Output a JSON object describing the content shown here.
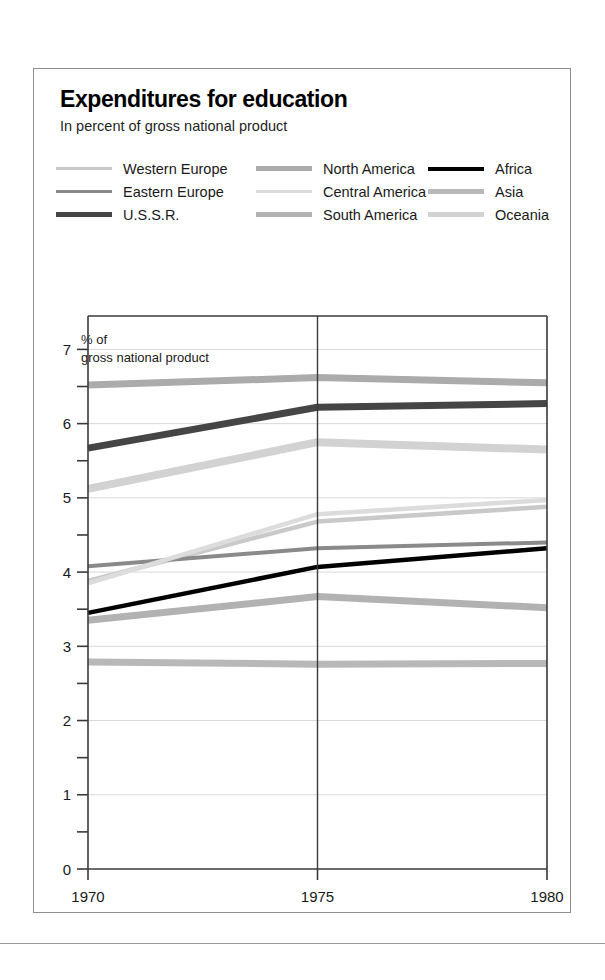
{
  "figure": {
    "title": "Expenditures for education",
    "subtitle": "In percent of gross national product",
    "axis_caption_line1": "% of",
    "axis_caption_line2": "gross national product"
  },
  "chart_data": {
    "type": "line",
    "title": "Expenditures for education",
    "subtitle": "In percent of gross national product",
    "xlabel": "",
    "ylabel": "% of gross national product",
    "x": [
      1970,
      1975,
      1980
    ],
    "xtick_labels": [
      "1970",
      "1975",
      "1980"
    ],
    "ytick_labels": [
      "0",
      "1",
      "2",
      "3",
      "4",
      "5",
      "6",
      "7"
    ],
    "yticks": [
      0,
      1,
      2,
      3,
      4,
      5,
      6,
      7
    ],
    "minor_yticks": [
      0.5,
      1.5,
      2.5,
      3.5,
      4.5,
      5.5,
      6.5
    ],
    "ylim": [
      0,
      7.45
    ],
    "xlim": [
      1970,
      1980
    ],
    "grid": "horizontal-light",
    "legend_position": "top",
    "series": [
      {
        "name": "Western Europe",
        "values": [
          3.88,
          4.68,
          4.88
        ],
        "color": "#c9c9c9",
        "width": 4.5
      },
      {
        "name": "Eastern Europe",
        "values": [
          4.08,
          4.32,
          4.4
        ],
        "color": "#8a8a8a",
        "width": 4.0
      },
      {
        "name": "U.S.S.R.",
        "values": [
          5.67,
          6.22,
          6.27
        ],
        "color": "#454545",
        "width": 7.0
      },
      {
        "name": "North America",
        "values": [
          6.52,
          6.62,
          6.55
        ],
        "color": "#ababab",
        "width": 7.0
      },
      {
        "name": "Central America",
        "values": [
          3.85,
          4.78,
          4.97
        ],
        "color": "#dcdcdc",
        "width": 4.5
      },
      {
        "name": "South America",
        "values": [
          3.35,
          3.67,
          3.52
        ],
        "color": "#b2b2b2",
        "width": 7.0
      },
      {
        "name": "Africa",
        "values": [
          3.45,
          4.07,
          4.32
        ],
        "color": "#000000",
        "width": 4.5
      },
      {
        "name": "Asia",
        "values": [
          2.79,
          2.76,
          2.77
        ],
        "color": "#b8b8b8",
        "width": 7.0
      },
      {
        "name": "Oceania",
        "values": [
          5.12,
          5.75,
          5.65
        ],
        "color": "#d2d2d2",
        "width": 8.0
      }
    ]
  },
  "legend": {
    "columns": [
      [
        {
          "label": "Western Europe",
          "color": "#c9c9c9",
          "thickness": 3
        },
        {
          "label": "Eastern Europe",
          "color": "#8a8a8a",
          "thickness": 3
        },
        {
          "label": "U.S.S.R.",
          "color": "#454545",
          "thickness": 5
        }
      ],
      [
        {
          "label": "North America",
          "color": "#ababab",
          "thickness": 5
        },
        {
          "label": "Central America",
          "color": "#dcdcdc",
          "thickness": 3
        },
        {
          "label": "South America",
          "color": "#b2b2b2",
          "thickness": 5
        }
      ],
      [
        {
          "label": "Africa",
          "color": "#000000",
          "thickness": 4
        },
        {
          "label": "Asia",
          "color": "#b8b8b8",
          "thickness": 5
        },
        {
          "label": "Oceania",
          "color": "#d2d2d2",
          "thickness": 5
        }
      ]
    ]
  }
}
